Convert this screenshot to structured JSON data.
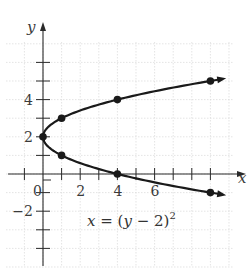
{
  "chart_data": {
    "type": "line",
    "title": "",
    "equation": "x = (y − 2)^2",
    "xlabel": "x",
    "ylabel": "y",
    "xlim": [
      -2,
      10
    ],
    "ylim": [
      -5,
      8
    ],
    "grid": true,
    "x_tick_labels": [
      {
        "value": 0,
        "label": "0"
      },
      {
        "value": 2,
        "label": "2"
      },
      {
        "value": 4,
        "label": "4"
      },
      {
        "value": 6,
        "label": "6"
      }
    ],
    "y_tick_labels": [
      {
        "value": -2,
        "label": "−2"
      },
      {
        "value": 2,
        "label": "2"
      },
      {
        "value": 4,
        "label": "4"
      }
    ],
    "x_ticks": [
      -1,
      1,
      2,
      3,
      4,
      5,
      6,
      7,
      8,
      9
    ],
    "y_ticks": [
      -4,
      -3,
      -2,
      -1,
      1,
      2,
      3,
      4,
      5,
      6
    ],
    "series": [
      {
        "name": "x = (y − 2)^2",
        "points": [
          {
            "x": 9,
            "y": -1
          },
          {
            "x": 4,
            "y": 0
          },
          {
            "x": 1,
            "y": 1
          },
          {
            "x": 0,
            "y": 2
          },
          {
            "x": 1,
            "y": 3
          },
          {
            "x": 4,
            "y": 4
          },
          {
            "x": 9,
            "y": 5
          }
        ],
        "marked_points": [
          {
            "x": 0,
            "y": 2
          },
          {
            "x": 1,
            "y": 1
          },
          {
            "x": 1,
            "y": 3
          },
          {
            "x": 4,
            "y": 0
          },
          {
            "x": 4,
            "y": 4
          },
          {
            "x": 9,
            "y": -1
          },
          {
            "x": 9,
            "y": 5
          }
        ],
        "arrows_at_ends": true
      }
    ]
  },
  "labels": {
    "x_axis": "x",
    "y_axis": "y",
    "equation_lhs": "x",
    "equation_eq": " = (",
    "equation_var": "y",
    "equation_rest": " − 2)",
    "equation_exp": "2"
  },
  "colors": {
    "curve": "#1a1a1a",
    "axis": "#2a2a2a",
    "grid": "#d9d9d9"
  }
}
